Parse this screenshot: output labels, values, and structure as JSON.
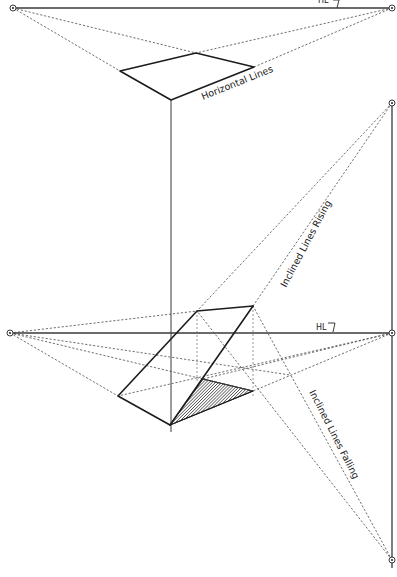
{
  "labels": {
    "horizon_top": "HL",
    "horizon_mid": "HL",
    "horizontal_lines": "Horizontal Lines",
    "inclined_rising": "Inclined Lines Rising",
    "inclined_falling": "Inclined Lines Falling"
  },
  "colors": {
    "ink": "#1c1c1c",
    "construction": "#4a4a4a",
    "background": "#ffffff",
    "hatch": "#2a2a2a"
  },
  "vanishing_points": {
    "top_left": [
      13,
      8
    ],
    "top_right": [
      392,
      8
    ],
    "mid_left": [
      10,
      333
    ],
    "mid_right": [
      392,
      333
    ],
    "inclined_up": [
      392,
      103
    ],
    "inclined_down": [
      392,
      560
    ]
  }
}
